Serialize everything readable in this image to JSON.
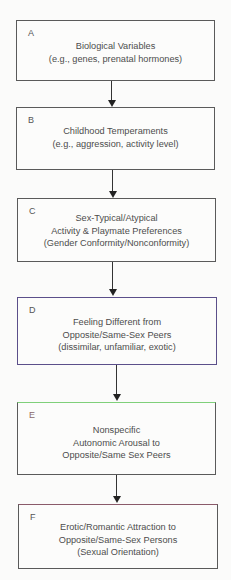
{
  "diagram": {
    "type": "flowchart",
    "direction": "top-to-bottom",
    "boxes": [
      {
        "letter": "A",
        "lines": [
          "Biological Variables",
          "(e.g., genes, prenatal hormones)"
        ]
      },
      {
        "letter": "B",
        "lines": [
          "Childhood Temperaments",
          "(e.g., aggression, activity level)"
        ]
      },
      {
        "letter": "C",
        "lines": [
          "Sex-Typical/Atypical",
          "Activity & Playmate Preferences",
          "(Gender Conformity/Nonconformity)"
        ]
      },
      {
        "letter": "D",
        "lines": [
          "Feeling Different from",
          "Opposite/Same-Sex Peers",
          "(dissimilar, unfamiliar, exotic)"
        ]
      },
      {
        "letter": "E",
        "lines": [
          "Nonspecific",
          "Autonomic Arousal to",
          "Opposite/Same Sex Peers"
        ]
      },
      {
        "letter": "F",
        "lines": [
          "Erotic/Romantic Attraction to",
          "Opposite/Same-Sex Persons",
          "(Sexual Orientation)"
        ]
      }
    ],
    "edges": [
      [
        "A",
        "B"
      ],
      [
        "B",
        "C"
      ],
      [
        "C",
        "D"
      ],
      [
        "D",
        "E"
      ],
      [
        "E",
        "F"
      ]
    ],
    "colors": {
      "box_border": "#5a5a5a",
      "box_d_border": "#5b4f8a",
      "box_e_top_border": "#7fd07a",
      "arrow": "#222222"
    }
  }
}
